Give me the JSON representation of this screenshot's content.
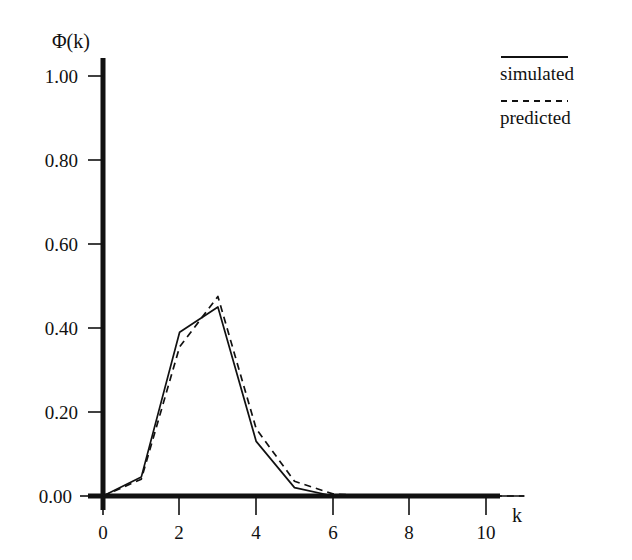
{
  "chart_data": {
    "type": "line",
    "title": "",
    "xlabel": "k",
    "ylabel": "Φ(k)",
    "xlim": [
      0,
      11
    ],
    "ylim": [
      0.0,
      1.05
    ],
    "grid": false,
    "legend_position": "top-right",
    "x": [
      0,
      1,
      2,
      3,
      4,
      5,
      6,
      7,
      8,
      9,
      10,
      11
    ],
    "xticks": [
      0,
      2,
      4,
      6,
      8,
      10
    ],
    "xtick_labels": [
      "0",
      "2",
      "4",
      "6",
      "8",
      "10"
    ],
    "yticks": [
      0.0,
      0.2,
      0.4,
      0.6,
      0.8,
      1.0
    ],
    "ytick_labels": [
      "0.00",
      "0.20",
      "0.40",
      "0.60",
      "0.80",
      "1.00"
    ],
    "series": [
      {
        "name": "simulated",
        "style": "solid",
        "color": "#111111",
        "values": [
          0.0,
          0.045,
          0.39,
          0.45,
          0.13,
          0.02,
          0.0,
          0.0,
          0.0,
          0.0,
          0.0,
          0.0
        ]
      },
      {
        "name": "predicted",
        "style": "dashed",
        "color": "#111111",
        "values": [
          0.0,
          0.04,
          0.355,
          0.475,
          0.16,
          0.035,
          0.005,
          0.0,
          0.0,
          0.0,
          0.0,
          0.0
        ]
      }
    ]
  },
  "axes": {
    "y_axis_title": "Φ(k)",
    "x_axis_title": "k"
  },
  "legend": {
    "entries": [
      {
        "label": "simulated",
        "style": "solid"
      },
      {
        "label": "predicted",
        "style": "dashed"
      }
    ]
  }
}
